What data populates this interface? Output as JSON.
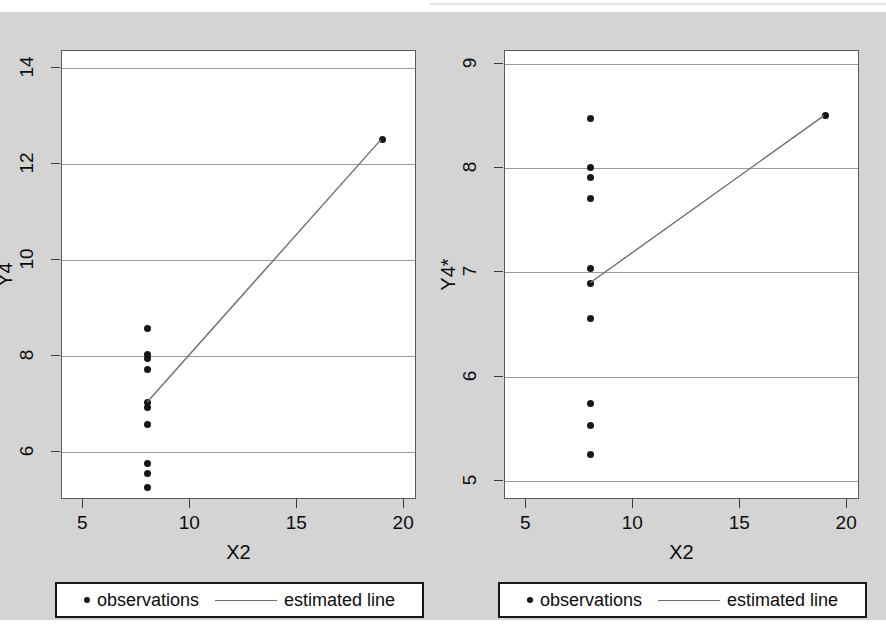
{
  "figure": {
    "background_color": "#d4d4d4",
    "plot_background_color": "#ffffff",
    "grid_color": "#9a9a9a",
    "marker_color": "#161616",
    "line_color": "#6e6e6e",
    "axis_color": "#3b3b3b"
  },
  "legend": {
    "observations_label": "observations",
    "estimated_line_label": "estimated line",
    "marker_icon": "filled-circle-icon",
    "line_icon": "horizontal-line-icon"
  },
  "chart_data": [
    {
      "type": "scatter",
      "panel": "left",
      "title": "",
      "xlabel": "X2",
      "ylabel": "Y4",
      "xlim": [
        4.0,
        20.6
      ],
      "ylim": [
        5.0,
        14.35
      ],
      "xticks": [
        5,
        10,
        15,
        20
      ],
      "yticks": [
        6,
        8,
        10,
        12,
        14
      ],
      "xtick_labels": [
        "5",
        "10",
        "15",
        "20"
      ],
      "ytick_labels": [
        "6",
        "8",
        "10",
        "12",
        "14"
      ],
      "grid": "horizontal",
      "legend_position": "below-plot",
      "series": [
        {
          "name": "observations",
          "type": "scatter",
          "points": [
            {
              "x": 8,
              "y": 8.58
            },
            {
              "x": 8,
              "y": 8.04
            },
            {
              "x": 8,
              "y": 7.95
            },
            {
              "x": 8,
              "y": 7.71
            },
            {
              "x": 8,
              "y": 7.04
            },
            {
              "x": 8,
              "y": 6.92
            },
            {
              "x": 8,
              "y": 6.58
            },
            {
              "x": 8,
              "y": 5.76
            },
            {
              "x": 8,
              "y": 5.56
            },
            {
              "x": 8,
              "y": 5.25
            },
            {
              "x": 19,
              "y": 12.5
            }
          ]
        },
        {
          "name": "estimated line",
          "type": "line",
          "points": [
            {
              "x": 8,
              "y": 7.0
            },
            {
              "x": 19,
              "y": 12.5
            }
          ]
        }
      ]
    },
    {
      "type": "scatter",
      "panel": "right",
      "title": "",
      "xlabel": "X2",
      "ylabel": "Y4*",
      "xlim": [
        4.0,
        20.6
      ],
      "ylim": [
        4.82,
        9.12
      ],
      "xticks": [
        5,
        10,
        15,
        20
      ],
      "yticks": [
        5,
        6,
        7,
        8,
        9
      ],
      "xtick_labels": [
        "5",
        "10",
        "15",
        "20"
      ],
      "ytick_labels": [
        "5",
        "6",
        "7",
        "8",
        "9"
      ],
      "grid": "horizontal",
      "legend_position": "below-plot",
      "series": [
        {
          "name": "observations",
          "type": "scatter",
          "points": [
            {
              "x": 8,
              "y": 8.47
            },
            {
              "x": 8,
              "y": 8.0
            },
            {
              "x": 8,
              "y": 7.91
            },
            {
              "x": 8,
              "y": 7.71
            },
            {
              "x": 8,
              "y": 7.04
            },
            {
              "x": 8,
              "y": 6.89
            },
            {
              "x": 8,
              "y": 6.56
            },
            {
              "x": 8,
              "y": 5.74
            },
            {
              "x": 8,
              "y": 5.53
            },
            {
              "x": 8,
              "y": 5.26
            },
            {
              "x": 19,
              "y": 8.5
            }
          ]
        },
        {
          "name": "estimated line",
          "type": "line",
          "points": [
            {
              "x": 8,
              "y": 6.89
            },
            {
              "x": 19,
              "y": 8.5
            }
          ]
        }
      ]
    }
  ]
}
